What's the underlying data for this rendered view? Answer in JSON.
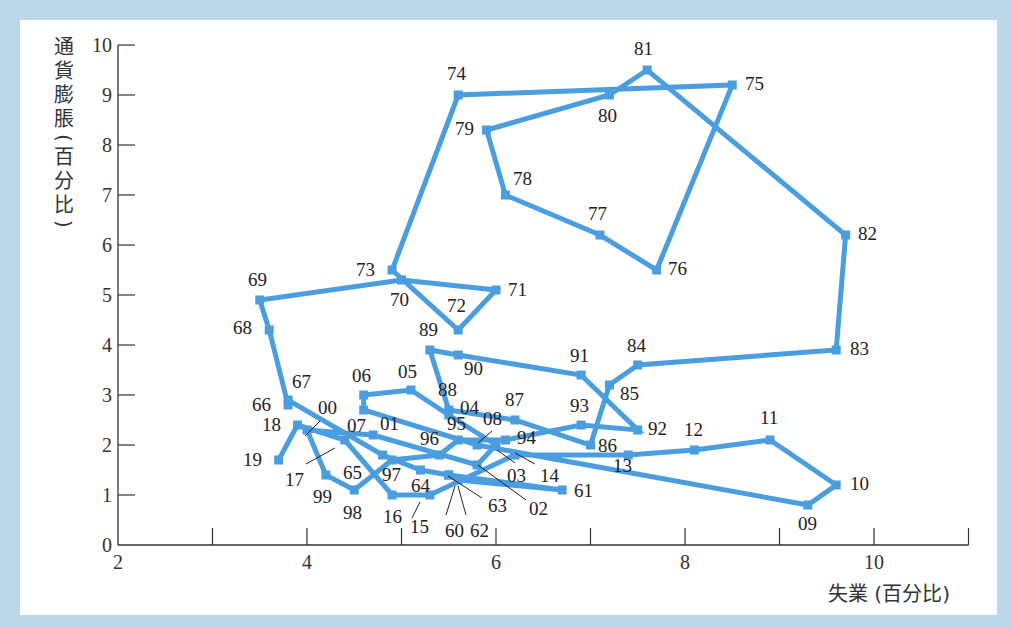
{
  "chart_data": {
    "type": "line",
    "title": "",
    "xlabel": "失業 (百分比)",
    "ylabel": "通貨膨脹 (百分比)",
    "ylabel_chars": [
      "通",
      "貨",
      "膨",
      "脹",
      "(",
      "百",
      "分",
      "比",
      ")"
    ],
    "xlim": [
      2,
      11
    ],
    "ylim": [
      0,
      10
    ],
    "x_ticks": [
      2,
      3,
      4,
      5,
      6,
      7,
      8,
      9,
      10,
      11
    ],
    "x_tick_labels": [
      "2",
      "",
      "4",
      "",
      "6",
      "",
      "8",
      "",
      "10",
      ""
    ],
    "y_ticks": [
      0,
      1,
      2,
      3,
      4,
      5,
      6,
      7,
      8,
      9,
      10
    ],
    "y_tick_labels": [
      "0",
      "1",
      "2",
      "3",
      "4",
      "5",
      "6",
      "7",
      "8",
      "9",
      "10"
    ],
    "grid": false,
    "line_color": "#4a9ee0",
    "series": [
      {
        "name": "失業 vs 通貨膨脹 (1960–2019)",
        "points": [
          {
            "label": "60",
            "x": 5.5,
            "y": 1.4
          },
          {
            "label": "61",
            "x": 6.7,
            "y": 1.1
          },
          {
            "label": "62",
            "x": 5.6,
            "y": 1.3
          },
          {
            "label": "63",
            "x": 5.5,
            "y": 1.4
          },
          {
            "label": "64",
            "x": 5.2,
            "y": 1.5
          },
          {
            "label": "65",
            "x": 4.8,
            "y": 1.8
          },
          {
            "label": "66",
            "x": 3.8,
            "y": 2.9
          },
          {
            "label": "67",
            "x": 3.8,
            "y": 2.8
          },
          {
            "label": "68",
            "x": 3.6,
            "y": 4.3
          },
          {
            "label": "69",
            "x": 3.5,
            "y": 4.9
          },
          {
            "label": "70",
            "x": 5.0,
            "y": 5.3
          },
          {
            "label": "71",
            "x": 6.0,
            "y": 5.1
          },
          {
            "label": "72",
            "x": 5.6,
            "y": 4.3
          },
          {
            "label": "73",
            "x": 4.9,
            "y": 5.5
          },
          {
            "label": "74",
            "x": 5.6,
            "y": 9.0
          },
          {
            "label": "75",
            "x": 8.5,
            "y": 9.2
          },
          {
            "label": "76",
            "x": 7.7,
            "y": 5.5
          },
          {
            "label": "77",
            "x": 7.1,
            "y": 6.2
          },
          {
            "label": "78",
            "x": 6.1,
            "y": 7.0
          },
          {
            "label": "79",
            "x": 5.9,
            "y": 8.3
          },
          {
            "label": "80",
            "x": 7.2,
            "y": 9.0
          },
          {
            "label": "81",
            "x": 7.6,
            "y": 9.5
          },
          {
            "label": "82",
            "x": 9.7,
            "y": 6.2
          },
          {
            "label": "83",
            "x": 9.6,
            "y": 3.9
          },
          {
            "label": "84",
            "x": 7.5,
            "y": 3.6
          },
          {
            "label": "85",
            "x": 7.2,
            "y": 3.2
          },
          {
            "label": "86",
            "x": 7.0,
            "y": 2.0
          },
          {
            "label": "87",
            "x": 6.2,
            "y": 2.5
          },
          {
            "label": "88",
            "x": 5.5,
            "y": 2.7
          },
          {
            "label": "89",
            "x": 5.3,
            "y": 3.9
          },
          {
            "label": "90",
            "x": 5.6,
            "y": 3.8
          },
          {
            "label": "91",
            "x": 6.9,
            "y": 3.4
          },
          {
            "label": "92",
            "x": 7.5,
            "y": 2.3
          },
          {
            "label": "93",
            "x": 6.9,
            "y": 2.4
          },
          {
            "label": "94",
            "x": 6.1,
            "y": 2.1
          },
          {
            "label": "95",
            "x": 5.6,
            "y": 2.1
          },
          {
            "label": "96",
            "x": 5.4,
            "y": 1.8
          },
          {
            "label": "97",
            "x": 4.9,
            "y": 1.7
          },
          {
            "label": "98",
            "x": 4.5,
            "y": 1.1
          },
          {
            "label": "99",
            "x": 4.2,
            "y": 1.4
          },
          {
            "label": "00",
            "x": 4.0,
            "y": 2.3
          },
          {
            "label": "01",
            "x": 4.7,
            "y": 2.2
          },
          {
            "label": "02",
            "x": 5.8,
            "y": 1.6
          },
          {
            "label": "03",
            "x": 6.0,
            "y": 2.0
          },
          {
            "label": "04",
            "x": 5.5,
            "y": 2.6
          },
          {
            "label": "05",
            "x": 5.1,
            "y": 3.1
          },
          {
            "label": "06",
            "x": 4.6,
            "y": 3.0
          },
          {
            "label": "07",
            "x": 4.6,
            "y": 2.7
          },
          {
            "label": "08",
            "x": 5.8,
            "y": 2.0
          },
          {
            "label": "09",
            "x": 9.3,
            "y": 0.8
          },
          {
            "label": "10",
            "x": 9.6,
            "y": 1.2
          },
          {
            "label": "11",
            "x": 8.9,
            "y": 2.1
          },
          {
            "label": "12",
            "x": 8.1,
            "y": 1.9
          },
          {
            "label": "13",
            "x": 7.4,
            "y": 1.8
          },
          {
            "label": "14",
            "x": 6.2,
            "y": 1.8
          },
          {
            "label": "15",
            "x": 5.3,
            "y": 1.0
          },
          {
            "label": "16",
            "x": 4.9,
            "y": 1.0
          },
          {
            "label": "17",
            "x": 4.4,
            "y": 2.1
          },
          {
            "label": "18",
            "x": 3.9,
            "y": 2.4
          },
          {
            "label": "19",
            "x": 3.7,
            "y": 1.7
          }
        ]
      }
    ],
    "point_labels": [
      {
        "text": "60",
        "lx": 445,
        "ly": 537
      },
      {
        "text": "61",
        "lx": 574,
        "ly": 497
      },
      {
        "text": "62",
        "lx": 470,
        "ly": 537
      },
      {
        "text": "63",
        "lx": 488,
        "ly": 512
      },
      {
        "text": "64",
        "lx": 411,
        "ly": 492
      },
      {
        "text": "65",
        "lx": 343,
        "ly": 479
      },
      {
        "text": "66",
        "lx": 252,
        "ly": 411
      },
      {
        "text": "67",
        "lx": 292,
        "ly": 388
      },
      {
        "text": "68",
        "lx": 233,
        "ly": 334
      },
      {
        "text": "69",
        "lx": 248,
        "ly": 286
      },
      {
        "text": "70",
        "lx": 390,
        "ly": 306
      },
      {
        "text": "71",
        "lx": 508,
        "ly": 296
      },
      {
        "text": "72",
        "lx": 447,
        "ly": 312
      },
      {
        "text": "73",
        "lx": 356,
        "ly": 276
      },
      {
        "text": "74",
        "lx": 447,
        "ly": 80
      },
      {
        "text": "75",
        "lx": 745,
        "ly": 90
      },
      {
        "text": "76",
        "lx": 668,
        "ly": 275
      },
      {
        "text": "77",
        "lx": 588,
        "ly": 220
      },
      {
        "text": "78",
        "lx": 513,
        "ly": 185
      },
      {
        "text": "79",
        "lx": 455,
        "ly": 135
      },
      {
        "text": "80",
        "lx": 598,
        "ly": 122
      },
      {
        "text": "81",
        "lx": 634,
        "ly": 55
      },
      {
        "text": "82",
        "lx": 858,
        "ly": 240
      },
      {
        "text": "83",
        "lx": 850,
        "ly": 355
      },
      {
        "text": "84",
        "lx": 627,
        "ly": 352
      },
      {
        "text": "85",
        "lx": 620,
        "ly": 400
      },
      {
        "text": "86",
        "lx": 598,
        "ly": 452
      },
      {
        "text": "87",
        "lx": 505,
        "ly": 406
      },
      {
        "text": "88",
        "lx": 438,
        "ly": 396
      },
      {
        "text": "89",
        "lx": 419,
        "ly": 336
      },
      {
        "text": "90",
        "lx": 464,
        "ly": 375
      },
      {
        "text": "91",
        "lx": 570,
        "ly": 362
      },
      {
        "text": "92",
        "lx": 648,
        "ly": 435
      },
      {
        "text": "93",
        "lx": 570,
        "ly": 412
      },
      {
        "text": "94",
        "lx": 517,
        "ly": 444
      },
      {
        "text": "95",
        "lx": 447,
        "ly": 430
      },
      {
        "text": "96",
        "lx": 420,
        "ly": 445
      },
      {
        "text": "97",
        "lx": 382,
        "ly": 481
      },
      {
        "text": "98",
        "lx": 343,
        "ly": 519
      },
      {
        "text": "99",
        "lx": 313,
        "ly": 503
      },
      {
        "text": "00",
        "lx": 318,
        "ly": 414
      },
      {
        "text": "01",
        "lx": 380,
        "ly": 430
      },
      {
        "text": "02",
        "lx": 529,
        "ly": 515
      },
      {
        "text": "03",
        "lx": 507,
        "ly": 482
      },
      {
        "text": "04",
        "lx": 460,
        "ly": 414
      },
      {
        "text": "05",
        "lx": 398,
        "ly": 378
      },
      {
        "text": "06",
        "lx": 352,
        "ly": 382
      },
      {
        "text": "07",
        "lx": 347,
        "ly": 432
      },
      {
        "text": "08",
        "lx": 483,
        "ly": 425
      },
      {
        "text": "09",
        "lx": 798,
        "ly": 530
      },
      {
        "text": "10",
        "lx": 850,
        "ly": 490
      },
      {
        "text": "11",
        "lx": 760,
        "ly": 424
      },
      {
        "text": "12",
        "lx": 684,
        "ly": 436
      },
      {
        "text": "13",
        "lx": 613,
        "ly": 472
      },
      {
        "text": "14",
        "lx": 540,
        "ly": 482
      },
      {
        "text": "15",
        "lx": 410,
        "ly": 533
      },
      {
        "text": "16",
        "lx": 383,
        "ly": 523
      },
      {
        "text": "17",
        "lx": 285,
        "ly": 486
      },
      {
        "text": "18",
        "lx": 262,
        "ly": 431
      },
      {
        "text": "19",
        "lx": 243,
        "ly": 466
      }
    ],
    "leader_lines": [
      {
        "label": "00",
        "x1": 305,
        "y1": 436,
        "x2": 320,
        "y2": 421
      },
      {
        "label": "17",
        "x1": 306,
        "y1": 464,
        "x2": 335,
        "y2": 448
      },
      {
        "label": "08",
        "x1": 478,
        "y1": 443,
        "x2": 492,
        "y2": 431
      },
      {
        "label": "03",
        "x1": 497,
        "y1": 450,
        "x2": 515,
        "y2": 463
      },
      {
        "label": "14",
        "x1": 515,
        "y1": 453,
        "x2": 535,
        "y2": 464
      },
      {
        "label": "02",
        "x1": 478,
        "y1": 465,
        "x2": 526,
        "y2": 500
      },
      {
        "label": "63",
        "x1": 448,
        "y1": 476,
        "x2": 482,
        "y2": 498
      },
      {
        "label": "15",
        "x1": 420,
        "y1": 502,
        "x2": 412,
        "y2": 518
      },
      {
        "label": "60",
        "x1": 455,
        "y1": 486,
        "x2": 446,
        "y2": 515
      },
      {
        "label": "62",
        "x1": 458,
        "y1": 486,
        "x2": 466,
        "y2": 515
      }
    ]
  },
  "axes": {
    "x_title": "失業 (百分比)",
    "y_title_chars": [
      "通",
      "貨",
      "膨",
      "脹",
      "(",
      "百",
      "分",
      "比",
      ")"
    ]
  }
}
